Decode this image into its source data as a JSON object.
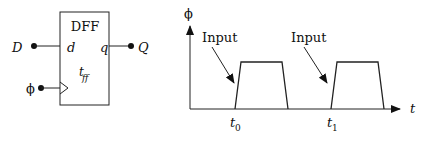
{
  "dff": {
    "title": "DFF",
    "input_port": "d",
    "output_port": "q",
    "delay_label": "t",
    "delay_sub": "ff",
    "input_signal": "D",
    "output_signal": "Q",
    "clock_signal": "ϕ"
  },
  "timing": {
    "y_axis_label": "ϕ",
    "x_axis_label": "t",
    "annotations": [
      {
        "label": "Input"
      },
      {
        "label": "Input"
      }
    ],
    "ticks": [
      {
        "base": "t",
        "sub": "0"
      },
      {
        "base": "t",
        "sub": "1"
      }
    ]
  }
}
